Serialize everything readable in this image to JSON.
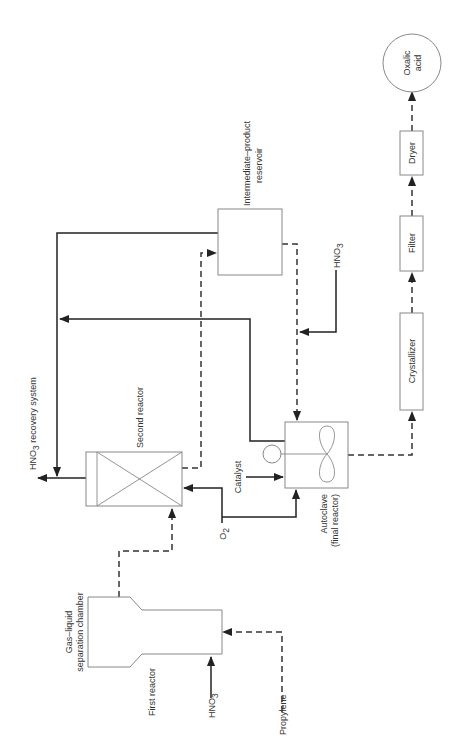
{
  "diagram": {
    "orientation": "rotated 90 degrees counter-clockwise",
    "units": {
      "first_reactor": "First reactor",
      "gas_liquid_chamber_line1": "Gas–liquid",
      "gas_liquid_chamber_line2": "separation chamber",
      "second_reactor": "Second reactor",
      "reservoir_line1": "Intermediate–product",
      "reservoir_line2": "reservoir",
      "autoclave_line1": "Autoclave",
      "autoclave_line2": "(final reactor)",
      "crystallizer": "Crystallizer",
      "filter": "Filter",
      "dryer": "Dryer",
      "product_line1": "Oxalic",
      "product_line2": "acid"
    },
    "streams": {
      "propylene": "Propylene",
      "hno3_base": "HNO",
      "hno3_sub": "3",
      "o2_base": "O",
      "o2_sub": "2",
      "catalyst": "Catalyst",
      "recovery_prefix": "HNO",
      "recovery_sub": "3",
      "recovery_suffix": " recovery system"
    },
    "legend": {
      "solid_line": "gas stream",
      "dashed_line": "liquid stream"
    }
  }
}
